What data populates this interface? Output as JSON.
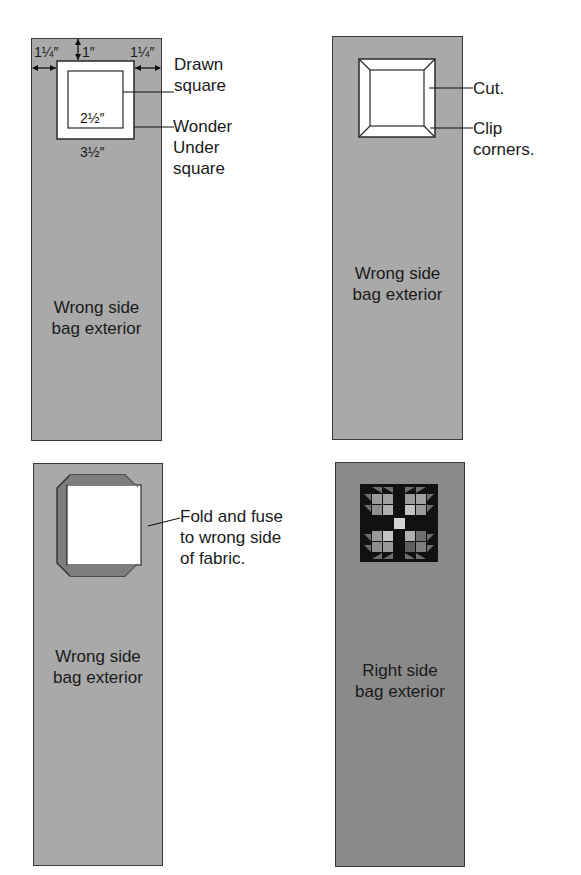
{
  "figure": {
    "panels": [
      {
        "id": "step-1",
        "caption": [
          "Wrong side",
          "bag exterior"
        ],
        "fill": "#a9a9a9",
        "dimensions": {
          "left_margin": "1¼″",
          "top_margin": "1″",
          "right_margin": "1¼″",
          "inner_square": "2½″",
          "outer_square": "3½″"
        },
        "callouts": [
          [
            "Drawn",
            "square"
          ],
          [
            "Wonder",
            "Under",
            "square"
          ]
        ]
      },
      {
        "id": "step-2",
        "caption": [
          "Wrong side",
          "bag exterior"
        ],
        "fill": "#a9a9a9",
        "callouts": [
          [
            "Cut."
          ],
          [
            "Clip",
            "corners."
          ]
        ]
      },
      {
        "id": "step-3",
        "caption": [
          "Wrong side",
          "bag exterior"
        ],
        "fill": "#a9a9a9",
        "callouts": [
          [
            "Fold and fuse",
            "to wrong side",
            "of fabric."
          ]
        ]
      },
      {
        "id": "step-4",
        "caption": [
          "Right side",
          "bag exterior"
        ],
        "fill": "#8a8a8a",
        "block": "patchwork-block"
      }
    ],
    "colors": {
      "panel_light": "#a9a9a9",
      "panel_dark": "#8a8a8a",
      "folded_flap": "#7d7d7d",
      "block_background": "#111111",
      "outline": "#2a2a2a"
    }
  }
}
